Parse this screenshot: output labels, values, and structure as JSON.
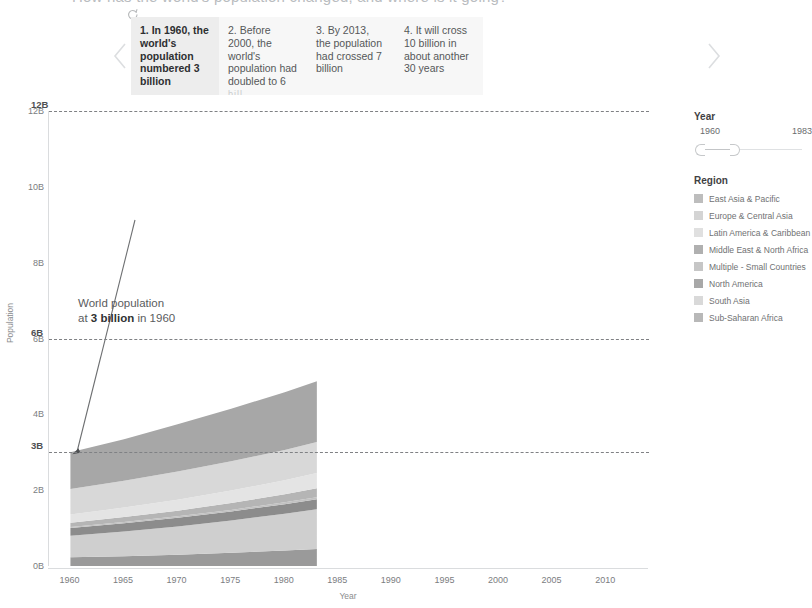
{
  "story": {
    "title": "How has the world's population changed, and where is it going?",
    "spinner_icon": "spinner-icon",
    "prev_icon": "chevron-left-icon",
    "next_icon": "chevron-right-icon",
    "points": [
      {
        "label": "1. In 1960, the world's population numbered 3 billion",
        "active": true,
        "truncated": ""
      },
      {
        "label": "2. Before 2000, the world's population had doubled to 6",
        "active": false,
        "truncated": "bill"
      },
      {
        "label": "3. By 2013, the population had crossed 7 billion",
        "active": false,
        "truncated": ""
      },
      {
        "label": "4. It will cross 10 billion in about another 30 years",
        "active": false,
        "truncated": ""
      }
    ]
  },
  "chart_data": {
    "type": "area",
    "title": "",
    "xlabel": "Year",
    "ylabel": "Population",
    "xlim": [
      1958,
      2014
    ],
    "ylim": [
      0,
      12
    ],
    "xticks": [
      1960,
      1965,
      1970,
      1975,
      1980,
      1985,
      1990,
      1995,
      2000,
      2005,
      2010
    ],
    "yticks": [
      0,
      2,
      4,
      6,
      8,
      10,
      12
    ],
    "ytick_labels": [
      "0B",
      "2B",
      "4B",
      "6B",
      "8B",
      "10B",
      "12B"
    ],
    "grid": false,
    "legend_position": "right",
    "data_range": [
      1960,
      1983
    ],
    "reference_lines": [
      {
        "label": "12B",
        "value": 12
      },
      {
        "label": "6B",
        "value": 6
      },
      {
        "label": "3B",
        "value": 3
      }
    ],
    "annotations": [
      {
        "text_line1": "World population",
        "text_line2_pre": "at ",
        "text_line2_bold": "3 billion",
        "text_line2_post": " in 1960",
        "target_x": 1960,
        "target_y": 3
      }
    ],
    "x": [
      1960,
      1965,
      1970,
      1975,
      1980,
      1983
    ],
    "series": [
      {
        "name": "Sub-Saharan Africa",
        "color": "#9a9a9a",
        "values": [
          0.23,
          0.26,
          0.3,
          0.35,
          0.41,
          0.45
        ]
      },
      {
        "name": "South Asia",
        "color": "#cfcfcf",
        "values": [
          0.57,
          0.65,
          0.74,
          0.85,
          0.97,
          1.05
        ]
      },
      {
        "name": "North America",
        "color": "#8c8c8c",
        "values": [
          0.2,
          0.22,
          0.23,
          0.24,
          0.25,
          0.26
        ]
      },
      {
        "name": "Multiple - Small Countries",
        "color": "#c2c2c2",
        "values": [
          0.03,
          0.03,
          0.04,
          0.04,
          0.05,
          0.05
        ]
      },
      {
        "name": "Middle East & North Africa",
        "color": "#b5b5b5",
        "values": [
          0.11,
          0.13,
          0.15,
          0.18,
          0.21,
          0.24
        ]
      },
      {
        "name": "Latin America & Caribbean",
        "color": "#e4e4e4",
        "values": [
          0.22,
          0.25,
          0.29,
          0.33,
          0.37,
          0.4
        ]
      },
      {
        "name": "Europe & Central Asia",
        "color": "#d8d8d8",
        "values": [
          0.67,
          0.71,
          0.74,
          0.77,
          0.8,
          0.82
        ]
      },
      {
        "name": "East Asia & Pacific",
        "color": "#a7a7a7",
        "values": [
          0.97,
          1.09,
          1.25,
          1.39,
          1.52,
          1.6
        ]
      }
    ]
  },
  "year_filter": {
    "heading": "Year",
    "min_label": "1960",
    "max_label": "1983"
  },
  "region_legend": {
    "heading": "Region",
    "items": [
      {
        "label": "East Asia & Pacific",
        "color": "#bdbdbd"
      },
      {
        "label": "Europe & Central Asia",
        "color": "#d4d4d4"
      },
      {
        "label": "Latin America & Caribbean",
        "color": "#e0e0e0"
      },
      {
        "label": "Middle East & North Africa",
        "color": "#b0b0b0"
      },
      {
        "label": "Multiple - Small Countries",
        "color": "#c6c6c6"
      },
      {
        "label": "North America",
        "color": "#a8a8a8"
      },
      {
        "label": "South Asia",
        "color": "#d9d9d9"
      },
      {
        "label": "Sub-Saharan Africa",
        "color": "#b8b8b8"
      }
    ]
  }
}
